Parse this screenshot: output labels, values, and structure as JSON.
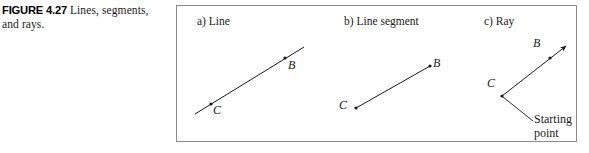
{
  "caption": {
    "figure_tag": "FIGURE 4.27",
    "line1_text": "Lines, segments,",
    "line2_text": "and rays."
  },
  "figure": {
    "panels": [
      {
        "id": "a",
        "title": "a) Line",
        "point_labels": [
          "B",
          "C"
        ]
      },
      {
        "id": "b",
        "title": "b) Line segment",
        "point_labels": [
          "B",
          "C"
        ]
      },
      {
        "id": "c",
        "title": "c) Ray",
        "point_labels": [
          "B",
          "C"
        ]
      }
    ],
    "annotation": {
      "starting_point_line1": "Starting",
      "starting_point_line2": "point"
    },
    "colors": {
      "ink": "#1a1a1a",
      "frame": "#8a8a8a",
      "background": "#ffffff"
    }
  }
}
